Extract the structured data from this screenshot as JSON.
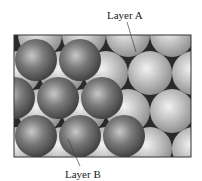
{
  "figure": {
    "labels": {
      "layer_a": "Layer A",
      "layer_b": "Layer B"
    },
    "colors": {
      "layer_a_sphere": "#b8b8b8",
      "layer_b_sphere": "#6e6e6e",
      "background_gap": "#2a2a2a",
      "frame": "#333333"
    }
  }
}
